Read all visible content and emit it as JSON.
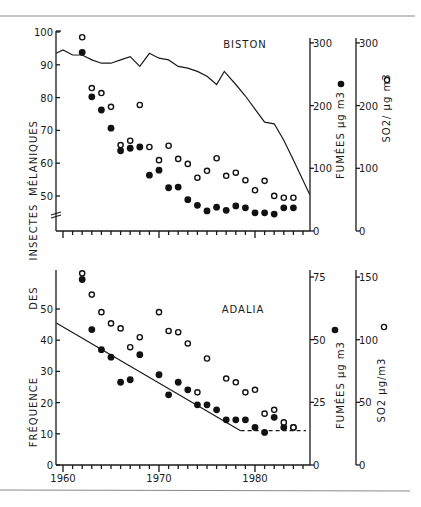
{
  "chart_data": [
    {
      "type": "line+scatter",
      "title": "BISTON",
      "ylabel": "FRÉQUENCE DES INSECTES MÉLANIQUES",
      "xlim": [
        1959.3,
        1985.7
      ],
      "left_axis": {
        "ticks": [
          50,
          60,
          70,
          80,
          90,
          100
        ],
        "range": [
          45,
          100
        ],
        "axis_break": true
      },
      "right_axis_1": {
        "label": "FUMÉES µg m3",
        "marker": "filled",
        "ticks": [
          0,
          100,
          200,
          300
        ],
        "range": [
          0,
          300
        ]
      },
      "right_axis_2": {
        "label": "SO2 / µg m3",
        "marker": "open",
        "ticks": [
          0,
          100,
          200,
          300
        ],
        "range": [
          0,
          300
        ]
      },
      "series": [
        {
          "name": "Fréquence des insectes mélaniques",
          "style": "line",
          "axis": "left",
          "x": [
            1959.3,
            1960,
            1961,
            1962,
            1963,
            1964,
            1965,
            1966,
            1967,
            1968,
            1969,
            1970,
            1971,
            1972,
            1973,
            1974,
            1975,
            1976,
            1976.8,
            1978,
            1979,
            1980,
            1981,
            1982,
            1983,
            1984,
            1985.7
          ],
          "values": [
            93.5,
            94.5,
            93,
            93,
            91.5,
            90.5,
            90.5,
            91.5,
            92.5,
            89.5,
            93.5,
            92,
            91.5,
            89.5,
            89,
            88,
            86.5,
            84,
            88,
            84,
            80.5,
            76.5,
            72.5,
            72,
            67,
            61,
            50.5
          ]
        },
        {
          "name": "Fumées µg m3",
          "style": "filled",
          "axis": "right_1",
          "x": [
            1962,
            1963,
            1964,
            1965,
            1966,
            1967,
            1968,
            1969,
            1970,
            1971,
            1972,
            1973,
            1974,
            1975,
            1976,
            1977,
            1978,
            1979,
            1980,
            1981,
            1982,
            1983,
            1984
          ],
          "values": [
            285,
            214,
            193,
            164,
            128,
            132,
            134,
            89,
            97,
            69,
            70,
            50,
            41,
            32,
            38,
            33,
            40,
            37,
            29,
            29,
            27,
            37,
            37
          ]
        },
        {
          "name": "SO2 µg m3",
          "style": "open",
          "axis": "right_2",
          "x": [
            1962,
            1963,
            1964,
            1965,
            1966,
            1967,
            1968,
            1969,
            1970,
            1971,
            1972,
            1973,
            1974,
            1975,
            1976,
            1977,
            1978,
            1979,
            1980,
            1981,
            1982,
            1983,
            1984
          ],
          "values": [
            309,
            228,
            220,
            198,
            137,
            144,
            201,
            134,
            113,
            136,
            115,
            107,
            85,
            96,
            116,
            88,
            93,
            81,
            65,
            80,
            56,
            53,
            53
          ]
        }
      ]
    },
    {
      "type": "line+scatter",
      "title": "ADALIA",
      "ylabel": "FRÉQUENCE DES INSECTES MÉLANIQUES",
      "xlabel": "",
      "x_ticks": [
        1960,
        1970,
        1980
      ],
      "xlim": [
        1959.3,
        1985.7
      ],
      "left_axis": {
        "ticks": [
          0,
          10,
          20,
          30,
          40,
          50
        ],
        "range": [
          0,
          60
        ]
      },
      "right_axis_1": {
        "label": "FUMÉES µg m3",
        "marker": "filled",
        "ticks": [
          0,
          25,
          50,
          75
        ],
        "range": [
          0,
          75
        ]
      },
      "right_axis_2": {
        "label": "SO2 µg/m3",
        "marker": "open",
        "ticks": [
          0,
          50,
          100,
          150
        ],
        "range": [
          0,
          150
        ]
      },
      "series": [
        {
          "name": "Tendance fréquence (régression)",
          "style": "line",
          "axis": "left",
          "x": [
            1959.3,
            1978.5
          ],
          "values": [
            45.5,
            11
          ]
        },
        {
          "name": "Tendance fréquence (plateau)",
          "style": "dashed",
          "axis": "left",
          "x": [
            1978.5,
            1985.3
          ],
          "values": [
            11,
            11
          ]
        },
        {
          "name": "Fumées µg m3",
          "style": "filled",
          "axis": "right_1",
          "x": [
            1962,
            1963,
            1964,
            1965,
            1966,
            1967,
            1968,
            1970,
            1971,
            1972,
            1973,
            1974,
            1975,
            1976,
            1977,
            1978,
            1979,
            1980,
            1981,
            1982,
            1983,
            1984
          ],
          "values": [
            74,
            54,
            46,
            43,
            33,
            34,
            44,
            36,
            28,
            33,
            30,
            24,
            24,
            22,
            18,
            18,
            18,
            15,
            13,
            19,
            15,
            15
          ]
        },
        {
          "name": "SO2 µg/m3",
          "style": "open",
          "axis": "right_2",
          "x": [
            1962,
            1963,
            1964,
            1965,
            1966,
            1967,
            1968,
            1970,
            1971,
            1972,
            1973,
            1974,
            1975,
            1977,
            1978,
            1979,
            1980,
            1981,
            1982,
            1983,
            1984
          ],
          "values": [
            153,
            136,
            122,
            113,
            109,
            94,
            102,
            122,
            107,
            106,
            97,
            58,
            85,
            69,
            66,
            58,
            60,
            41,
            44,
            34,
            30
          ]
        }
      ]
    }
  ],
  "labels": {
    "ylabel_words": [
      "FRÉQUENCE",
      "DES",
      "INSECTES",
      "MÉLANIQUES"
    ],
    "top_title": "BISTON",
    "bottom_title": "ADALIA",
    "fumees_label": "FUMÉES  µg m3",
    "so2_top_label": "SO2/ µg m3",
    "so2_bottom_label": "SO2   µg/m3",
    "x_tick_labels": [
      "1960",
      "1970",
      "1980"
    ]
  }
}
